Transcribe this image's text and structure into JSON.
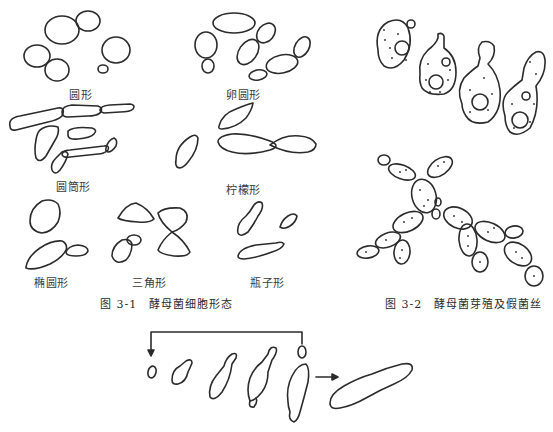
{
  "figure_3_1": {
    "caption_number": "图 3-1",
    "caption_title": "酵母菌细胞形态",
    "shape_labels": {
      "round": "圆形",
      "oval": "卵圆形",
      "cylindrical": "圆筒形",
      "lemon": "柠檬形",
      "elliptical": "椭圆形",
      "triangular": "三角形",
      "flask": "瓶子形"
    }
  },
  "figure_3_2": {
    "caption_number": "图 3-2",
    "caption_title": "酵母菌芽殖及假菌丝"
  },
  "bottom_sequence": {
    "stages": 5,
    "description": "budding sequence with feedback arrow leading to elongated pseudohyphal cell"
  },
  "colors": {
    "ink": "#2b2b2b",
    "background": "#ffffff"
  }
}
